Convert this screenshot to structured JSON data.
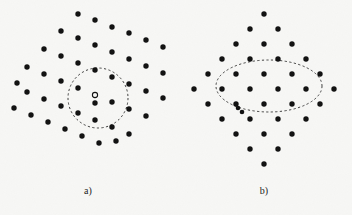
{
  "figure": {
    "type": "scientific-diagram",
    "width": 352,
    "height": 215,
    "background_color": "#f7f7f5",
    "atom_color": "#101010",
    "annotation_color": "#2a2a2a",
    "atom_radius": 2.7,
    "dash_pattern": "2.2 2.4",
    "dash_width": 0.9
  },
  "panels": [
    {
      "id": "a",
      "caption": "a)",
      "description": "tilted (rotated) square lattice of atoms with a dashed circular region marking a point defect; an open (hollow) circle marks a vacancy site next to a filled atom",
      "lattice": {
        "kind": "rotated-square",
        "rotation_deg": 18,
        "spacing": 17.5,
        "center": [
          96,
          97
        ]
      },
      "annotation": {
        "shape": "circle",
        "cx": 98,
        "cy": 98,
        "rx": 30,
        "ry": 30,
        "style": "dashed"
      },
      "marker": {
        "shape": "open-circle",
        "cx": 95,
        "cy": 95,
        "r": 2.6,
        "label": "vacancy-marker"
      },
      "atoms": [
        [
          78,
          14
        ],
        [
          95,
          20
        ],
        [
          61,
          31
        ],
        [
          112,
          27
        ],
        [
          78,
          38
        ],
        [
          44,
          49
        ],
        [
          129,
          33
        ],
        [
          95,
          45
        ],
        [
          61,
          56
        ],
        [
          27,
          67
        ],
        [
          146,
          40
        ],
        [
          112,
          52
        ],
        [
          78,
          63
        ],
        [
          44,
          74
        ],
        [
          17,
          83
        ],
        [
          163,
          47
        ],
        [
          129,
          59
        ],
        [
          95,
          70
        ],
        [
          61,
          81
        ],
        [
          27,
          92
        ],
        [
          146,
          66
        ],
        [
          112,
          77
        ],
        [
          78,
          88
        ],
        [
          44,
          99
        ],
        [
          14,
          108
        ],
        [
          163,
          73
        ],
        [
          129,
          84
        ],
        [
          95,
          103
        ],
        [
          61,
          106
        ],
        [
          31,
          115
        ],
        [
          146,
          91
        ],
        [
          112,
          102
        ],
        [
          78,
          113
        ],
        [
          48,
          122
        ],
        [
          163,
          98
        ],
        [
          129,
          109
        ],
        [
          95,
          120
        ],
        [
          65,
          129
        ],
        [
          146,
          116
        ],
        [
          112,
          127
        ],
        [
          82,
          136
        ],
        [
          129,
          134
        ],
        [
          99,
          143
        ],
        [
          116,
          141
        ]
      ]
    },
    {
      "id": "b",
      "caption": "b)",
      "description": "regular (unrotated) square lattice arranged in a diamond outline with a dashed elliptical region marking a localized defect; a split interstitial (dumbbell pair of atoms) sits just below the ellipse",
      "lattice": {
        "kind": "square",
        "rotation_deg": 0,
        "spacing_x": 28,
        "spacing_y": 21,
        "center": [
          88,
          97
        ]
      },
      "annotation": {
        "shape": "ellipse",
        "cx": 93,
        "cy": 86,
        "rx": 53,
        "ry": 26,
        "style": "dashed"
      },
      "marker": {
        "shape": "split-interstitial",
        "atoms": [
          [
            62,
            108
          ],
          [
            66,
            112
          ]
        ],
        "label": "interstitial-dumbbell"
      },
      "atoms": [
        [
          88,
          14
        ],
        [
          74,
          29
        ],
        [
          102,
          29
        ],
        [
          60,
          44
        ],
        [
          88,
          44
        ],
        [
          116,
          44
        ],
        [
          46,
          59
        ],
        [
          74,
          59
        ],
        [
          102,
          59
        ],
        [
          130,
          59
        ],
        [
          32,
          74
        ],
        [
          60,
          74
        ],
        [
          88,
          74
        ],
        [
          116,
          74
        ],
        [
          144,
          74
        ],
        [
          18,
          89
        ],
        [
          46,
          89
        ],
        [
          74,
          89
        ],
        [
          102,
          89
        ],
        [
          130,
          89
        ],
        [
          158,
          89
        ],
        [
          32,
          104
        ],
        [
          60,
          104
        ],
        [
          88,
          104
        ],
        [
          116,
          104
        ],
        [
          144,
          104
        ],
        [
          46,
          119
        ],
        [
          74,
          119
        ],
        [
          102,
          119
        ],
        [
          130,
          119
        ],
        [
          60,
          134
        ],
        [
          88,
          134
        ],
        [
          116,
          134
        ],
        [
          74,
          149
        ],
        [
          102,
          149
        ],
        [
          88,
          164
        ]
      ]
    }
  ],
  "chart_data": {
    "type": "scatter",
    "title": "",
    "xlabel": "",
    "ylabel": "",
    "legend": [],
    "series": [
      {
        "name": "panel-a-atoms",
        "count": 44
      },
      {
        "name": "panel-b-atoms",
        "count": 36
      },
      {
        "name": "panel-b-interstitial-pair",
        "count": 2
      },
      {
        "name": "panel-a-vacancy",
        "count": 1
      }
    ]
  }
}
